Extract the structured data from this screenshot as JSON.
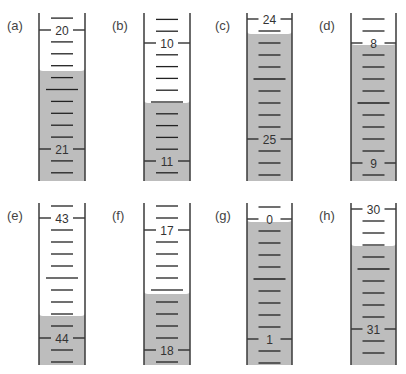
{
  "colors": {
    "liquid": "#bdbdbd",
    "wall": "#3a3a3a",
    "tick": "#222222",
    "label": "#444444"
  },
  "tubes": [
    {
      "id": "a",
      "label": "(a)",
      "x": 39,
      "w": 46,
      "top": 13,
      "bottom": 181,
      "major1": {
        "value": "20",
        "y": 30
      },
      "major2": {
        "value": "21",
        "y": 149
      },
      "liquidTop": 68
    },
    {
      "id": "b",
      "label": "(b)",
      "x": 144,
      "w": 46,
      "top": 13,
      "bottom": 181,
      "major1": {
        "value": "10",
        "y": 43
      },
      "major2": {
        "value": "11",
        "y": 161
      },
      "liquidTop": 100
    },
    {
      "id": "c",
      "label": "(c)",
      "x": 247,
      "w": 45,
      "top": 13,
      "bottom": 181,
      "major1": {
        "value": "24",
        "y": 19
      },
      "major2": {
        "value": "25",
        "y": 139
      },
      "liquidTop": 31
    },
    {
      "id": "d",
      "label": "(d)",
      "x": 351,
      "w": 45,
      "top": 13,
      "bottom": 181,
      "major1": {
        "value": "8",
        "y": 43
      },
      "major2": {
        "value": "9",
        "y": 163
      },
      "liquidTop": 42
    },
    {
      "id": "e",
      "label": "(e)",
      "x": 39,
      "w": 46,
      "top": 203,
      "bottom": 365,
      "major1": {
        "value": "43",
        "y": 218
      },
      "major2": {
        "value": "44",
        "y": 338
      },
      "liquidTop": 313
    },
    {
      "id": "f",
      "label": "(f)",
      "x": 144,
      "w": 46,
      "top": 203,
      "bottom": 365,
      "major1": {
        "value": "17",
        "y": 230
      },
      "major2": {
        "value": "18",
        "y": 350
      },
      "liquidTop": 291
    },
    {
      "id": "g",
      "label": "(g)",
      "x": 247,
      "w": 45,
      "top": 203,
      "bottom": 365,
      "major1": {
        "value": "0",
        "y": 219
      },
      "major2": {
        "value": "1",
        "y": 339
      },
      "liquidTop": 219
    },
    {
      "id": "h",
      "label": "(h)",
      "x": 351,
      "w": 45,
      "top": 203,
      "bottom": 365,
      "major1": {
        "value": "30",
        "y": 209
      },
      "major2": {
        "value": "31",
        "y": 329
      },
      "liquidTop": 243
    }
  ]
}
